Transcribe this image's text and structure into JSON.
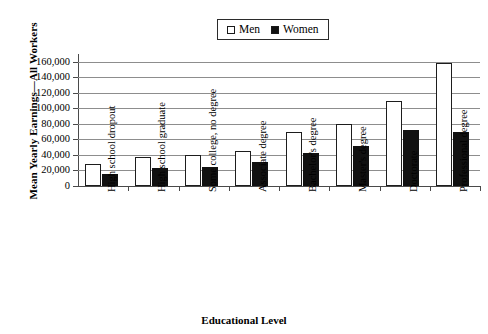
{
  "chart_data": {
    "type": "bar",
    "title": "",
    "xlabel": "Educational Level",
    "ylabel": "Mean Yearly Earnings—All Workers",
    "categories": [
      "High school dropout",
      "High school graduate",
      "Some college, no degree",
      "Associate degree",
      "Bachelor's degree",
      "Master's degree",
      "Doctorate",
      "Professional degree"
    ],
    "series": [
      {
        "name": "Men",
        "color": "#ffffff",
        "values": [
          28000,
          38000,
          40000,
          45000,
          70000,
          80000,
          110000,
          158000
        ]
      },
      {
        "name": "Women",
        "color": "#111111",
        "values": [
          16000,
          23000,
          25000,
          31000,
          43000,
          52000,
          72000,
          70000
        ]
      }
    ],
    "ylim": [
      0,
      170000
    ],
    "yticks": [
      0,
      20000,
      40000,
      60000,
      80000,
      100000,
      120000,
      140000,
      160000
    ],
    "ytick_labels": [
      "0",
      "20,000",
      "40,000",
      "60,000",
      "80,000",
      "100,000",
      "120,000",
      "140,000",
      "160,000"
    ],
    "grid": true,
    "legend_position": "top-center"
  },
  "legend": {
    "entries": [
      {
        "label": "Men",
        "swatch": "hollow-square-icon"
      },
      {
        "label": "Women",
        "swatch": "filled-square-icon"
      }
    ]
  }
}
